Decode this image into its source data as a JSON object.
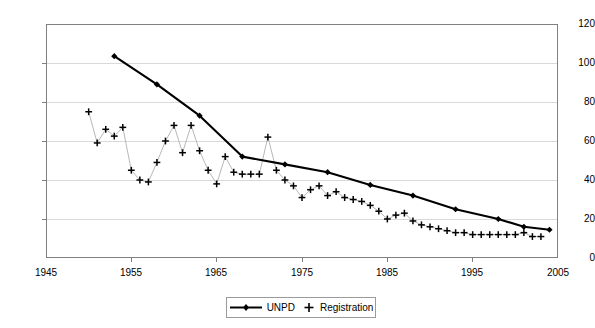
{
  "chart_data": {
    "type": "line",
    "title": "",
    "xlabel": "",
    "ylabel": "",
    "xlim": [
      1945,
      2005
    ],
    "ylim": [
      0,
      120
    ],
    "xticks": [
      1945,
      1955,
      1965,
      1975,
      1985,
      1995,
      2005
    ],
    "yticks": [
      0,
      20,
      40,
      60,
      80,
      100,
      120
    ],
    "grid": "horizontal",
    "legend_position": "bottom-center",
    "series": [
      {
        "name": "UNPD",
        "marker": "diamond",
        "style": "line-with-markers",
        "color": "#000000",
        "x": [
          1953,
          1958,
          1963,
          1968,
          1973,
          1978,
          1983,
          1988,
          1993,
          1998,
          2001,
          2004
        ],
        "values": [
          103.5,
          89,
          73,
          52,
          48,
          44,
          37.5,
          32,
          25,
          20,
          16,
          14.5
        ],
        "points": [
          {
            "year": 1953,
            "value": 103.5
          },
          {
            "year": 1958,
            "value": 89
          },
          {
            "year": 1963,
            "value": 73
          },
          {
            "year": 1968,
            "value": 52
          },
          {
            "year": 1973,
            "value": 48
          },
          {
            "year": 1978,
            "value": 44
          },
          {
            "year": 1983,
            "value": 37.5
          },
          {
            "year": 1988,
            "value": 32
          },
          {
            "year": 1993,
            "value": 25
          },
          {
            "year": 1998,
            "value": 20
          },
          {
            "year": 2001,
            "value": 16
          },
          {
            "year": 2004,
            "value": 14.5
          }
        ]
      },
      {
        "name": "Registration",
        "marker": "plus",
        "style": "thin-line-with-markers",
        "color": "#000000",
        "x": [
          1950,
          1951,
          1952,
          1953,
          1954,
          1955,
          1956,
          1957,
          1958,
          1959,
          1960,
          1961,
          1962,
          1963,
          1964,
          1965,
          1966,
          1967,
          1968,
          1969,
          1970,
          1971,
          1972,
          1973,
          1974,
          1975,
          1976,
          1977,
          1978,
          1979,
          1980,
          1981,
          1982,
          1983,
          1984,
          1985,
          1986,
          1987,
          1988,
          1989,
          1990,
          1991,
          1992,
          1993,
          1994,
          1995,
          1996,
          1997,
          1998,
          1999,
          2000,
          2001,
          2002,
          2003
        ],
        "values": [
          75,
          59,
          66,
          62.5,
          67,
          45,
          40,
          39,
          49,
          60,
          68,
          54,
          68,
          55,
          45,
          38,
          52,
          44,
          43,
          43,
          43,
          62,
          45,
          40,
          37,
          31,
          35,
          37,
          32,
          34,
          31,
          30,
          29,
          27,
          24,
          20,
          22,
          23,
          19,
          17,
          16,
          15,
          14,
          13,
          13,
          12,
          12,
          12,
          12,
          12,
          12,
          13,
          11,
          11
        ],
        "points": [
          {
            "year": 1950,
            "value": 75
          },
          {
            "year": 1951,
            "value": 59
          },
          {
            "year": 1952,
            "value": 66
          },
          {
            "year": 1953,
            "value": 62.5
          },
          {
            "year": 1954,
            "value": 67
          },
          {
            "year": 1955,
            "value": 45
          },
          {
            "year": 1956,
            "value": 40
          },
          {
            "year": 1957,
            "value": 39
          },
          {
            "year": 1958,
            "value": 49
          },
          {
            "year": 1959,
            "value": 60
          },
          {
            "year": 1960,
            "value": 68
          },
          {
            "year": 1961,
            "value": 54
          },
          {
            "year": 1962,
            "value": 68
          },
          {
            "year": 1963,
            "value": 55
          },
          {
            "year": 1964,
            "value": 45
          },
          {
            "year": 1965,
            "value": 38
          },
          {
            "year": 1966,
            "value": 52
          },
          {
            "year": 1967,
            "value": 44
          },
          {
            "year": 1968,
            "value": 43
          },
          {
            "year": 1969,
            "value": 43
          },
          {
            "year": 1970,
            "value": 43
          },
          {
            "year": 1971,
            "value": 62
          },
          {
            "year": 1972,
            "value": 45
          },
          {
            "year": 1973,
            "value": 40
          },
          {
            "year": 1974,
            "value": 37
          },
          {
            "year": 1975,
            "value": 31
          },
          {
            "year": 1976,
            "value": 35
          },
          {
            "year": 1977,
            "value": 37
          },
          {
            "year": 1978,
            "value": 32
          },
          {
            "year": 1979,
            "value": 34
          },
          {
            "year": 1980,
            "value": 31
          },
          {
            "year": 1981,
            "value": 30
          },
          {
            "year": 1982,
            "value": 29
          },
          {
            "year": 1983,
            "value": 27
          },
          {
            "year": 1984,
            "value": 24
          },
          {
            "year": 1985,
            "value": 20
          },
          {
            "year": 1986,
            "value": 22
          },
          {
            "year": 1987,
            "value": 23
          },
          {
            "year": 1988,
            "value": 19
          },
          {
            "year": 1989,
            "value": 17
          },
          {
            "year": 1990,
            "value": 16
          },
          {
            "year": 1991,
            "value": 15
          },
          {
            "year": 1992,
            "value": 14
          },
          {
            "year": 1993,
            "value": 13
          },
          {
            "year": 1994,
            "value": 13
          },
          {
            "year": 1995,
            "value": 12
          },
          {
            "year": 1996,
            "value": 12
          },
          {
            "year": 1997,
            "value": 12
          },
          {
            "year": 1998,
            "value": 12
          },
          {
            "year": 1999,
            "value": 12
          },
          {
            "year": 2000,
            "value": 12
          },
          {
            "year": 2001,
            "value": 13
          },
          {
            "year": 2002,
            "value": 11
          },
          {
            "year": 2003,
            "value": 11
          }
        ]
      }
    ]
  },
  "axes": {
    "y_labels": [
      "0",
      "20",
      "40",
      "60",
      "80",
      "100",
      "120"
    ],
    "x_labels": [
      "1945",
      "1955",
      "1965",
      "1975",
      "1985",
      "1995",
      "2005"
    ]
  },
  "legend": {
    "entries": [
      {
        "label": "UNPD",
        "symbol": "line-diamond-marker"
      },
      {
        "label": "Registration",
        "symbol": "plus-marker"
      }
    ]
  },
  "colors": {
    "axis": "#808080",
    "grid": "#d9d9d9",
    "unpd": "#000000",
    "registration": "#000000",
    "registration_line": "#b8b8b8",
    "background": "#ffffff"
  }
}
